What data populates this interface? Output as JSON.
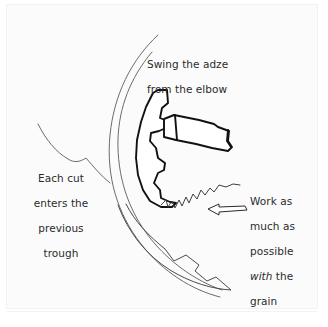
{
  "figure": {
    "type": "line-drawing-illustration",
    "background_color": "#ffffff",
    "panel_color": "#fbfbfb",
    "ink_color": "#1a1a1a",
    "thin_ink_color": "#4a4a4a",
    "text_color": "#2b2b2b",
    "width": 328,
    "height": 327
  },
  "annotations": {
    "swing": {
      "name": "swing-the-adze-callout",
      "line1": "Swing the adze",
      "line2": "from the elbow"
    },
    "each_cut": {
      "name": "each-cut-callout",
      "line1": "Each cut",
      "line2": "enters the",
      "line3": "previous",
      "line4": "trough"
    },
    "grain": {
      "name": "work-with-grain-callout",
      "line1": "Work as",
      "line2": "much as",
      "line3": "possible",
      "line4_italic": "with",
      "line4_rest": " the",
      "line5": "grain"
    }
  },
  "graphics": {
    "adze_tool": "adze-blade-and-handle-outline",
    "swing_arc_outer": "outer-swing-arc",
    "swing_arc_inner": "inner-swing-arc",
    "swing_arrow": "curved-swing-arrow",
    "workpiece_edge": "curved-timber-edge",
    "trough_line": "previous-trough-curve",
    "grain_surface": "serrated-adzed-surface",
    "grain_arrow": "left-pointing-grain-direction-arrow"
  }
}
